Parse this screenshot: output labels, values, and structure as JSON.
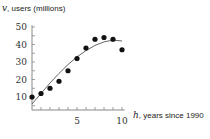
{
  "chart_data": {
    "type": "scatter",
    "title": "",
    "xlabel": "h, years since 1990",
    "ylabel": "v, users (millions)",
    "xlabel_var": "h",
    "xlabel_text": ", years since 1990",
    "ylabel_var": "v",
    "ylabel_text": ", users (millions)",
    "x_ticks": [
      5,
      10
    ],
    "x_minor_ticks": [
      1,
      2,
      3,
      4,
      5,
      6,
      7,
      8,
      9,
      10
    ],
    "y_ticks": [
      10,
      20,
      30,
      40,
      50
    ],
    "xlim": [
      0,
      10.5
    ],
    "ylim": [
      0,
      52
    ],
    "grid": false,
    "legend": null,
    "series": [
      {
        "name": "data points",
        "type": "scatter",
        "x": [
          0,
          1,
          2,
          3,
          4,
          5,
          6,
          7,
          8,
          9,
          10
        ],
        "y": [
          10,
          12,
          15,
          19,
          25,
          32,
          38,
          43,
          44,
          43,
          37
        ]
      },
      {
        "name": "fitted curve",
        "type": "line",
        "x": [
          0,
          1,
          2,
          3,
          4,
          5,
          6,
          7,
          8,
          9,
          10
        ],
        "y": [
          6,
          12,
          18,
          23.5,
          28.5,
          33,
          36.5,
          39.5,
          41.5,
          42.5,
          42
        ]
      }
    ],
    "colors": {
      "points": "#111111",
      "curve": "#555555",
      "axis": "#888888"
    }
  }
}
